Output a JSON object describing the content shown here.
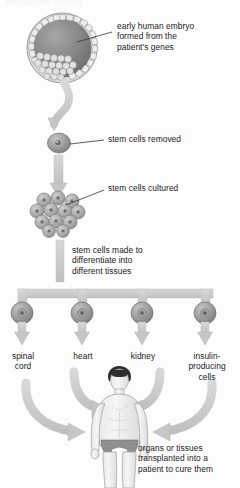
{
  "figure": {
    "title_fragment": "therapeutic cloning",
    "palette": {
      "background": "#fdfdfd",
      "text": "#222222",
      "arrow_fill": "#c9c9c9",
      "arrow_stroke": "#b0b0b0",
      "cell_dark": "#6f6f6f",
      "cell_mid": "#9a9a9a",
      "cell_light": "#d6d6d6",
      "embryo_rim": "#d9d9d9",
      "embryo_core": "#7a7a7a",
      "skin": "#f0f0f0",
      "hair": "#2e2e2e",
      "trunks": "#8a8a8a"
    }
  },
  "labels": {
    "embryo": "early human embryo\nformed from the\npatient's genes",
    "removed": "stem cells removed",
    "cultured": "stem cells cultured",
    "differentiate": "stem cells made to\ndifferentiate into\ndifferent tissues",
    "transplant": "organs or tissues\ntransplanted into a\npatient to cure them"
  },
  "tissues": [
    {
      "label": "spinal\ncord",
      "cx": 22
    },
    {
      "label": "heart",
      "cx": 82
    },
    {
      "label": "kidney",
      "cx": 142
    },
    {
      "label": "insulin-\nproducing\ncells",
      "cx": 205
    }
  ],
  "stages": [
    {
      "name": "blastocyst",
      "caption": "early human embryo formed from the patient's genes"
    },
    {
      "name": "single-stem-cell",
      "caption": "stem cells removed"
    },
    {
      "name": "cell-culture-cluster",
      "caption": "stem cells cultured"
    },
    {
      "name": "differentiation-branch",
      "caption": "stem cells made to differentiate into different tissues"
    },
    {
      "name": "patient-body",
      "caption": "organs or tissues transplanted into a patient to cure them"
    }
  ]
}
